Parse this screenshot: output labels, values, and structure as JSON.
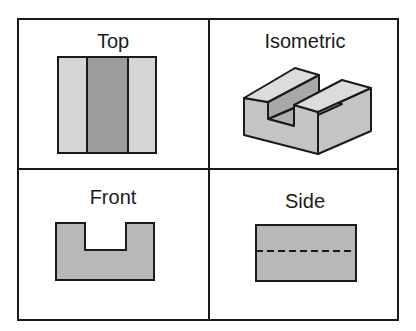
{
  "panels": {
    "top": {
      "label": "Top"
    },
    "isometric": {
      "label": "Isometric"
    },
    "front": {
      "label": "Front"
    },
    "side": {
      "label": "Side"
    }
  },
  "colors": {
    "line": "#1a1a1a",
    "light_fill": "#d6d6d6",
    "mid_fill": "#b8b8b8",
    "dark_fill": "#9c9c9c"
  }
}
